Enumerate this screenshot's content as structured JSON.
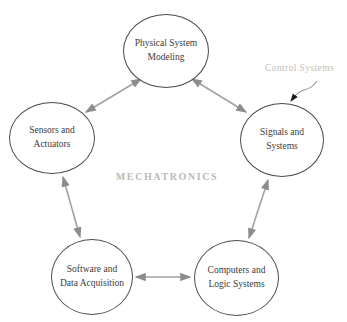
{
  "title": "MECHATRONICS",
  "nodes": [
    {
      "id": "physical-system-modeling",
      "label": "Physical System\nModeling"
    },
    {
      "id": "sensors-and-actuators",
      "label": "Sensors and\nActuators"
    },
    {
      "id": "signals-and-systems",
      "label": "Signals and\nSystems"
    },
    {
      "id": "software-and-data-acquisition",
      "label": "Software and\nData Acquisition"
    },
    {
      "id": "computers-and-logic-systems",
      "label": "Computers and\nLogic Systems"
    }
  ],
  "edges": [
    {
      "from": "physical-system-modeling",
      "to": "sensors-and-actuators",
      "bidirectional": true
    },
    {
      "from": "physical-system-modeling",
      "to": "signals-and-systems",
      "bidirectional": true
    },
    {
      "from": "sensors-and-actuators",
      "to": "software-and-data-acquisition",
      "bidirectional": true
    },
    {
      "from": "software-and-data-acquisition",
      "to": "computers-and-logic-systems",
      "bidirectional": true
    },
    {
      "from": "computers-and-logic-systems",
      "to": "signals-and-systems",
      "bidirectional": true
    }
  ],
  "annotation": {
    "label": "Control Systems",
    "target": "signals-and-systems"
  },
  "colors": {
    "background": "#ffffff",
    "circle_outline": "#4a4a4a",
    "circle_text": "#3b3b3b",
    "arrow_line": "#a2a2a2",
    "arrow_head": "#8d8d8d",
    "title_gray": "#b9b9b9",
    "annotation_gray": "#bfbeb6",
    "annotation_arrowhead": "#1a1a1a"
  }
}
